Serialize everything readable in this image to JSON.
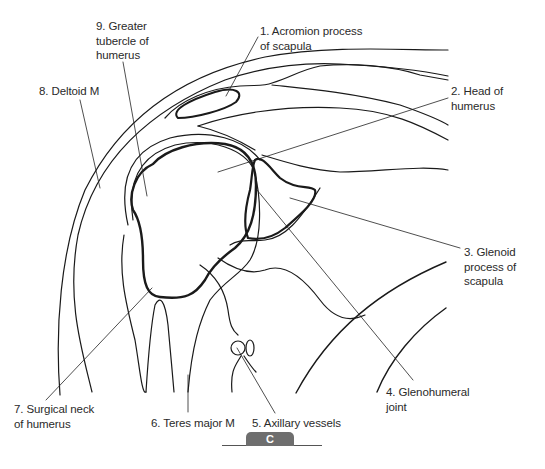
{
  "figure": {
    "panel_letter": "C",
    "line_color": "#1a1a1a",
    "badge_color": "#6e6e6e"
  },
  "labels": [
    {
      "id": "1",
      "text": "1. Acromion process\nof scapula",
      "x": 260,
      "y": 24
    },
    {
      "id": "2",
      "text": "2. Head of\nhumerus",
      "x": 451,
      "y": 84
    },
    {
      "id": "3",
      "text": "3. Glenoid\nprocess of\nscapula",
      "x": 464,
      "y": 245
    },
    {
      "id": "4",
      "text": "4. Glenohumeral\njoint",
      "x": 386,
      "y": 385
    },
    {
      "id": "5",
      "text": "5. Axillary vessels",
      "x": 252,
      "y": 416
    },
    {
      "id": "6",
      "text": "6. Teres major M",
      "x": 151,
      "y": 416
    },
    {
      "id": "7",
      "text": "7. Surgical neck\nof humerus",
      "x": 14,
      "y": 402
    },
    {
      "id": "8",
      "text": "8. Deltoid M",
      "x": 39,
      "y": 84
    },
    {
      "id": "9",
      "text": "9. Greater\ntubercle of\nhumerus",
      "x": 96,
      "y": 19
    }
  ]
}
